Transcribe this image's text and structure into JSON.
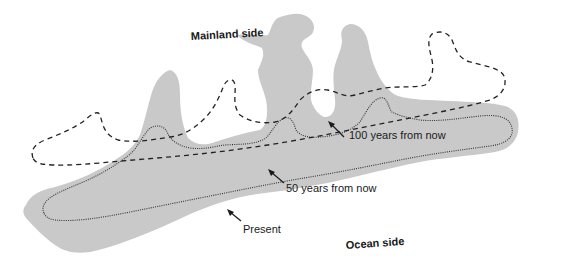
{
  "diagram": {
    "labels": {
      "mainland": "Mainland side",
      "ocean": "Ocean side",
      "present": "Present",
      "fifty": "50 years from now",
      "hundred": "100 years from now"
    },
    "legend": [
      {
        "key": "present",
        "style": "gray fill",
        "label": "Present"
      },
      {
        "key": "fifty",
        "style": "dotted outline",
        "label": "50 years from now"
      },
      {
        "key": "hundred",
        "style": "dashed outline",
        "label": "100 years from now"
      }
    ],
    "colors": {
      "island_fill": "#c9c9c9",
      "line": "#222222",
      "text": "#1a1a1a"
    }
  }
}
